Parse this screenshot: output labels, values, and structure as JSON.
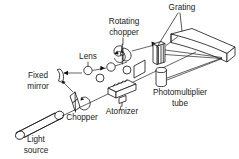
{
  "figure": {
    "background_color": "#ffffff",
    "line_color": "#111111",
    "text_color": "#1a1a1a"
  },
  "labels": {
    "grating": "Grating",
    "rotating_chopper_line1": "Rotating",
    "rotating_chopper_line2": "chopper",
    "lens": "Lens",
    "fixed_mirror_line1": "Fixed",
    "fixed_mirror_line2": "mirror",
    "chopper": "Chopper",
    "atomizer": "Atomizer",
    "light_source_line1": "Light",
    "light_source_line2": "source",
    "photomultiplier_line1": "Photomultiplier",
    "photomultiplier_line2": "tube"
  },
  "components": [
    {
      "name": "light-source",
      "label": "Light source"
    },
    {
      "name": "chopper",
      "label": "Chopper"
    },
    {
      "name": "fixed-mirror",
      "label": "Fixed mirror"
    },
    {
      "name": "lens",
      "label": "Lens"
    },
    {
      "name": "atomizer",
      "label": "Atomizer"
    },
    {
      "name": "rotating-chopper",
      "label": "Rotating chopper"
    },
    {
      "name": "grating",
      "label": "Grating"
    },
    {
      "name": "photomultiplier-tube",
      "label": "Photomultiplier tube"
    },
    {
      "name": "concave-mirror",
      "label": ""
    }
  ]
}
